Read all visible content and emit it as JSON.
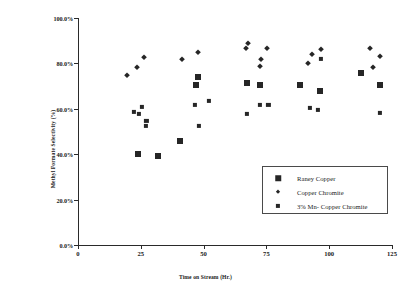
{
  "chart_data": {
    "type": "scatter",
    "title": "",
    "xlabel": "Time on Stream (Hr.)",
    "ylabel": "Methyl Formate Selectivity (%)",
    "xlim": [
      0,
      125
    ],
    "ylim": [
      0,
      100
    ],
    "xticks": [
      "0",
      "25",
      "50",
      "75",
      "100",
      "125"
    ],
    "xtick_values": [
      0,
      25,
      50,
      75,
      100,
      125
    ],
    "yticks": [
      "0.0%",
      "20.0%",
      "40.0%",
      "60.0%",
      "80.0%",
      "100.0%"
    ],
    "ytick_values": [
      0,
      20,
      40,
      60,
      80,
      100
    ],
    "grid": false,
    "legend_position": "inside-lower-right",
    "series": [
      {
        "name": "Raney Copper",
        "marker": "large-filled-square",
        "color": "#262626",
        "points": [
          [
            23.8,
            40.2
          ],
          [
            24.0,
            40.0
          ],
          [
            31.8,
            39.0
          ],
          [
            40.6,
            45.8
          ],
          [
            46.9,
            70.4
          ],
          [
            47.9,
            74.0
          ],
          [
            67.2,
            71.2
          ],
          [
            72.6,
            70.6
          ],
          [
            88.2,
            70.5
          ],
          [
            96.2,
            67.8
          ],
          [
            112.6,
            75.6
          ],
          [
            120.2,
            70.4
          ]
        ]
      },
      {
        "name": "Copper Chromite",
        "marker": "diamond",
        "color": "#262626",
        "points": [
          [
            19.6,
            74.8
          ],
          [
            23.4,
            78.6
          ],
          [
            26.4,
            82.6
          ],
          [
            41.6,
            81.8
          ],
          [
            47.8,
            85.2
          ],
          [
            67.0,
            86.6
          ],
          [
            67.7,
            88.8
          ],
          [
            72.4,
            78.8
          ],
          [
            73.0,
            82.0
          ],
          [
            75.4,
            86.8
          ],
          [
            91.5,
            80.2
          ],
          [
            93.1,
            84.0
          ],
          [
            96.6,
            86.2
          ],
          [
            116.4,
            86.6
          ],
          [
            117.5,
            78.6
          ],
          [
            120.4,
            83.4
          ]
        ]
      },
      {
        "name": "3% Mn- Copper Chromite",
        "marker": "medium-square",
        "color": "#262626",
        "points": [
          [
            22.4,
            58.8
          ],
          [
            24.4,
            57.6
          ],
          [
            25.6,
            61.0
          ],
          [
            26.9,
            52.3
          ],
          [
            27.2,
            54.5
          ],
          [
            46.7,
            61.8
          ],
          [
            48.1,
            52.4
          ],
          [
            52.0,
            63.4
          ],
          [
            67.2,
            57.6
          ],
          [
            72.3,
            61.6
          ],
          [
            75.8,
            61.8
          ],
          [
            92.2,
            60.4
          ],
          [
            95.6,
            59.6
          ],
          [
            96.8,
            82.0
          ],
          [
            120.2,
            58.2
          ]
        ]
      }
    ]
  },
  "legend": {
    "items": [
      {
        "label": "Raney Copper",
        "marker": "raney"
      },
      {
        "label": "Copper Chromite",
        "marker": "chromite"
      },
      {
        "label": "3% Mn- Copper Chromite",
        "marker": "mn"
      }
    ]
  }
}
